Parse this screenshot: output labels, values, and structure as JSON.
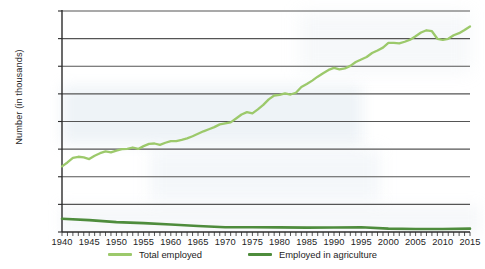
{
  "chart_data": {
    "type": "line",
    "title": "",
    "xlabel": "",
    "ylabel": "Number (in thousands)",
    "xlim": [
      1940,
      2015
    ],
    "ylim": [
      0,
      160000
    ],
    "grid": true,
    "legend_position": "bottom",
    "y_ticks": [
      "0",
      "20,000",
      "40,000",
      "60,000",
      "80,000",
      "100,000",
      "120,000",
      "140,000",
      "160,000"
    ],
    "y_tick_values": [
      0,
      20000,
      40000,
      60000,
      80000,
      100000,
      120000,
      140000,
      160000
    ],
    "x_ticks": [
      "1940",
      "1945",
      "1950",
      "1955",
      "1960",
      "1965",
      "1970",
      "1975",
      "1980",
      "1985",
      "1990",
      "1995",
      "2000",
      "2005",
      "2010",
      "2015"
    ],
    "x_tick_values": [
      1940,
      1945,
      1950,
      1955,
      1960,
      1965,
      1970,
      1975,
      1980,
      1985,
      1990,
      1995,
      2000,
      2005,
      2010,
      2015
    ],
    "x_minor_tick_step": 1,
    "colors": {
      "total_employed": "#9CC96B",
      "employed_in_agriculture": "#4E8C3C",
      "gridline": "#555555",
      "axis": "#2b2b2b"
    },
    "series": [
      {
        "name": "Total employed",
        "color": "#9CC96B",
        "x": [
          1940,
          1941,
          1942,
          1943,
          1944,
          1945,
          1946,
          1947,
          1948,
          1949,
          1950,
          1951,
          1952,
          1953,
          1954,
          1955,
          1956,
          1957,
          1958,
          1959,
          1960,
          1961,
          1962,
          1963,
          1964,
          1965,
          1966,
          1967,
          1968,
          1969,
          1970,
          1971,
          1972,
          1973,
          1974,
          1975,
          1976,
          1977,
          1978,
          1979,
          1980,
          1981,
          1982,
          1983,
          1984,
          1985,
          1986,
          1987,
          1988,
          1989,
          1990,
          1991,
          1992,
          1993,
          1994,
          1995,
          1996,
          1997,
          1998,
          1999,
          2000,
          2001,
          2002,
          2003,
          2004,
          2005,
          2006,
          2007,
          2008,
          2009,
          2010,
          2011,
          2012,
          2013,
          2014,
          2015
        ],
        "values": [
          47520,
          50350,
          53750,
          54470,
          53960,
          52820,
          55250,
          57040,
          58340,
          57650,
          58920,
          59960,
          60250,
          61180,
          60110,
          62170,
          63800,
          64070,
          63040,
          64630,
          65780,
          65750,
          66700,
          67760,
          69300,
          71090,
          72900,
          74370,
          75920,
          77900,
          78680,
          79370,
          82150,
          85060,
          86790,
          85850,
          88750,
          92020,
          96050,
          98820,
          99300,
          100400,
          99530,
          100830,
          105000,
          107150,
          109600,
          112440,
          114970,
          117340,
          118790,
          117720,
          118490,
          120260,
          123060,
          124900,
          126710,
          129560,
          131460,
          133490,
          136890,
          136930,
          136490,
          137740,
          139250,
          141730,
          144430,
          146050,
          145360,
          139880,
          139060,
          139870,
          142470,
          143930,
          146300,
          148830
        ]
      },
      {
        "name": "Employed in agriculture",
        "color": "#4E8C3C",
        "x": [
          1940,
          1945,
          1950,
          1955,
          1960,
          1965,
          1970,
          1975,
          1980,
          1985,
          1990,
          1995,
          2000,
          2005,
          2010,
          2015
        ],
        "values": [
          9540,
          8580,
          7160,
          6450,
          5460,
          4360,
          3460,
          3410,
          3360,
          3180,
          3220,
          3440,
          2460,
          2200,
          2210,
          2420
        ]
      }
    ],
    "legend": [
      {
        "label": "Total employed",
        "color": "#9CC96B"
      },
      {
        "label": "Employed in agriculture",
        "color": "#4E8C3C"
      }
    ]
  }
}
